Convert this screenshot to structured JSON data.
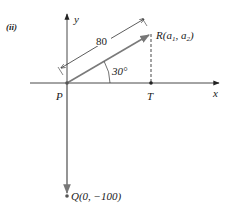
{
  "figure": {
    "part_label": "(ii)",
    "axes": {
      "x_label": "x",
      "y_label": "y"
    },
    "points": {
      "P": {
        "label": "P"
      },
      "T": {
        "label": "T"
      },
      "R": {
        "label": "R(a",
        "sub1": "1",
        "mid": ", a",
        "sub2": "2",
        "end": ")"
      },
      "Q": {
        "label": "Q(0, −100)"
      }
    },
    "dimension_label": "80",
    "angle_label": "30°",
    "colors": {
      "vector": "#7a7a7a",
      "axis": "#333333",
      "text": "#1a1a1a"
    }
  }
}
